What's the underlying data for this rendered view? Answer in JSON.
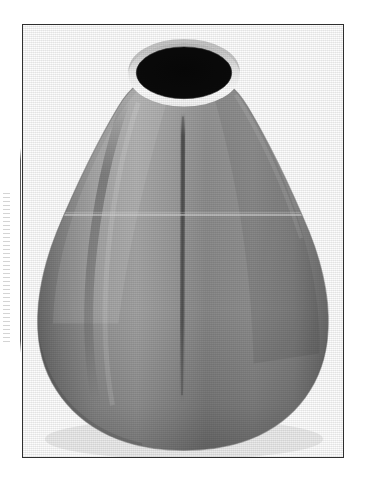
{
  "page": {
    "background_color": "#ffffff",
    "width_px": 365,
    "height_px": 485,
    "alt_text": "Grayscale scanned photograph of a conical metal nozzle"
  },
  "figure": {
    "frame": {
      "border_color": "#2f2f2f",
      "border_width_px": 1.5,
      "left_px": 22,
      "top_px": 24,
      "width_px": 322,
      "height_px": 434,
      "fill_color": "#fdfdfd"
    },
    "subject": {
      "name": "conical-nozzle",
      "description": "Pear shaped conical metal body with a circular opening at the top",
      "body_color_light": "#b4b4b4",
      "body_color_mid": "#8f8f8f",
      "body_color_dark": "#6a6a6a",
      "body_color_shadow": "#565656",
      "rim_highlight_color": "#fafafa",
      "aperture_color": "#0b0b0b",
      "seam_color": "#5a5a5a"
    },
    "aperture": {
      "name": "top-opening",
      "center_x_px": 184,
      "center_y_px": 74,
      "radius_x_px": 47,
      "radius_y_px": 26
    },
    "scan_artifacts": {
      "left_strip": {
        "name": "scan-edge-strip",
        "left_px": 3,
        "top_px": 193,
        "width_px": 7,
        "height_px": 150,
        "color": "#969696"
      },
      "vertical_rule": {
        "name": "scan-vertical-rule",
        "left_px": 20,
        "top_px": 148,
        "height_px": 205,
        "color": "#3c3c3c"
      },
      "horizontal_scan_line": {
        "name": "horizontal-scan-line",
        "y_px": 215,
        "color": "#c8c8c8"
      }
    }
  }
}
